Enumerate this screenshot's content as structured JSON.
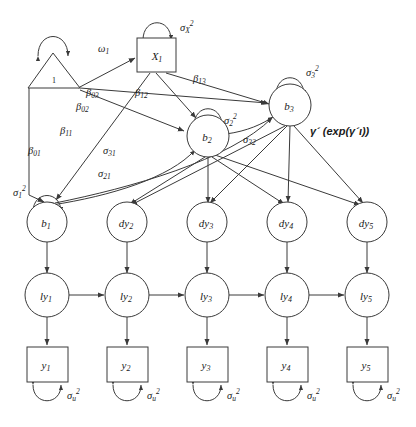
{
  "figure": {
    "type": "path-diagram"
  },
  "nodes": {
    "constant": {
      "label": "1",
      "shape": "triangle"
    },
    "x1": {
      "label": "X",
      "sub": "1",
      "shape": "rectangle"
    },
    "b1": {
      "label": "b",
      "sub": "1",
      "shape": "circle"
    },
    "b2": {
      "label": "b",
      "sub": "2",
      "shape": "circle"
    },
    "b3": {
      "label": "b",
      "sub": "3",
      "shape": "circle"
    },
    "dy2": {
      "label": "dy",
      "sub": "2",
      "shape": "circle"
    },
    "dy3": {
      "label": "dy",
      "sub": "3",
      "shape": "circle"
    },
    "dy4": {
      "label": "dy",
      "sub": "4",
      "shape": "circle"
    },
    "dy5": {
      "label": "dy",
      "sub": "5",
      "shape": "circle"
    },
    "ly1": {
      "label": "ly",
      "sub": "1",
      "shape": "circle"
    },
    "ly2": {
      "label": "ly",
      "sub": "2",
      "shape": "circle"
    },
    "ly3": {
      "label": "ly",
      "sub": "3",
      "shape": "circle"
    },
    "ly4": {
      "label": "ly",
      "sub": "4",
      "shape": "circle"
    },
    "ly5": {
      "label": "ly",
      "sub": "5",
      "shape": "circle"
    },
    "y1": {
      "label": "y",
      "sub": "1",
      "shape": "rectangle"
    },
    "y2": {
      "label": "y",
      "sub": "2",
      "shape": "rectangle"
    },
    "y3": {
      "label": "y",
      "sub": "3",
      "shape": "rectangle"
    },
    "y4": {
      "label": "y",
      "sub": "4",
      "shape": "rectangle"
    },
    "y5": {
      "label": "y",
      "sub": "5",
      "shape": "rectangle"
    }
  },
  "parameters": {
    "omega1": {
      "base": "ω",
      "sub": "1",
      "sup": ""
    },
    "sigmaX2": {
      "base": "σ",
      "sub": "X",
      "sup": "2"
    },
    "sigma1sq": {
      "base": "σ",
      "sub": "1",
      "sup": "2"
    },
    "sigma2sq": {
      "base": "σ",
      "sub": "2",
      "sup": "2"
    },
    "sigma3sq": {
      "base": "σ",
      "sub": "3",
      "sup": "2"
    },
    "sigma21": {
      "base": "σ",
      "sub": "21",
      "sup": ""
    },
    "sigma31": {
      "base": "σ",
      "sub": "31",
      "sup": ""
    },
    "sigma32": {
      "base": "σ",
      "sub": "32",
      "sup": ""
    },
    "sigmau2": {
      "base": "σ",
      "sub": "u",
      "sup": "2"
    },
    "beta01": {
      "base": "β",
      "sub": "01",
      "sup": ""
    },
    "beta02": {
      "base": "β",
      "sub": "02",
      "sup": ""
    },
    "beta03": {
      "base": "β",
      "sub": "03",
      "sup": ""
    },
    "beta11": {
      "base": "β",
      "sub": "11",
      "sup": ""
    },
    "beta12": {
      "base": "β",
      "sub": "12",
      "sup": ""
    },
    "beta13": {
      "base": "β",
      "sub": "13",
      "sup": ""
    },
    "gamma_expr": {
      "text": "γ´ (exp(γ´ι))"
    }
  },
  "style": {
    "stroke": "#3a3a3a",
    "fill": "#ffffff",
    "text": "#1a1a1a"
  }
}
